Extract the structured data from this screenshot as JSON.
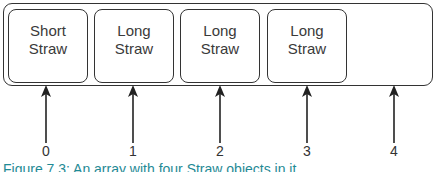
{
  "diagram": {
    "cells": [
      {
        "line1": "Short",
        "line2": "Straw"
      },
      {
        "line1": "Long",
        "line2": "Straw"
      },
      {
        "line1": "Long",
        "line2": "Straw"
      },
      {
        "line1": "Long",
        "line2": "Straw"
      },
      {
        "line1": "",
        "line2": ""
      }
    ],
    "indices": [
      "0",
      "1",
      "2",
      "3",
      "4"
    ]
  },
  "caption": "Figure 7.3: An array with four Straw objects in it"
}
